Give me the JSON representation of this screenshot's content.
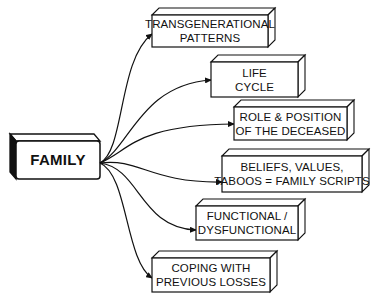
{
  "root": {
    "label": "FAMILY",
    "box": {
      "x": 16,
      "y": 141,
      "w": 84,
      "h": 38
    }
  },
  "nodes": [
    {
      "id": "transgenerational",
      "lines": [
        "TRANSGENERATIONAL",
        "PATTERNS"
      ],
      "box": {
        "x": 152,
        "y": 15,
        "w": 116,
        "h": 32
      }
    },
    {
      "id": "life-cycle",
      "lines": [
        "LIFE",
        "CYCLE"
      ],
      "box": {
        "x": 211,
        "y": 62,
        "w": 87,
        "h": 35
      }
    },
    {
      "id": "role-position",
      "lines": [
        "ROLE & POSITION",
        "OF THE DECEASED"
      ],
      "box": {
        "x": 234,
        "y": 107,
        "w": 113,
        "h": 33
      }
    },
    {
      "id": "beliefs-values",
      "lines": [
        "BELIEFS, VALUES,",
        "TABOOS = FAMILY SCRIPTS"
      ],
      "box": {
        "x": 222,
        "y": 156,
        "w": 140,
        "h": 36
      }
    },
    {
      "id": "functional",
      "lines": [
        "FUNCTIONAL /",
        "DYSFUNCTIONAL"
      ],
      "box": {
        "x": 196,
        "y": 206,
        "w": 102,
        "h": 34
      }
    },
    {
      "id": "coping",
      "lines": [
        "COPING WITH",
        "PREVIOUS LOSSES"
      ],
      "box": {
        "x": 152,
        "y": 258,
        "w": 118,
        "h": 34
      }
    }
  ],
  "colors": {
    "stroke": "#111111",
    "fill": "#ffffff",
    "text": "#111111"
  }
}
